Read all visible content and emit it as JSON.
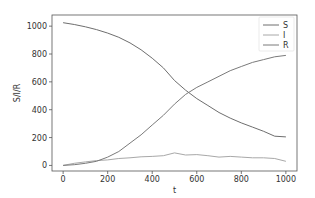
{
  "chart_data": {
    "type": "line",
    "title": "",
    "xlabel": "t",
    "ylabel": "S/I/R",
    "xlim": [
      -50,
      1050
    ],
    "ylim": [
      -40,
      1080
    ],
    "xticks": [
      0,
      200,
      400,
      600,
      800,
      1000
    ],
    "yticks": [
      0,
      200,
      400,
      600,
      800,
      1000
    ],
    "grid": false,
    "legend_position": "upper right",
    "x": [
      0,
      50,
      100,
      150,
      200,
      250,
      300,
      350,
      400,
      450,
      500,
      550,
      600,
      650,
      700,
      750,
      800,
      850,
      900,
      950,
      1000
    ],
    "series": [
      {
        "name": "S",
        "color": "#6e6e6e",
        "values": [
          1025,
          1012,
          995,
          975,
          950,
          920,
          880,
          830,
          770,
          700,
          610,
          540,
          480,
          430,
          380,
          340,
          305,
          275,
          245,
          210,
          205
        ]
      },
      {
        "name": "I",
        "color": "#a8a8a8",
        "values": [
          0,
          15,
          25,
          35,
          40,
          50,
          55,
          62,
          65,
          70,
          90,
          75,
          78,
          70,
          60,
          65,
          60,
          55,
          55,
          50,
          30
        ]
      },
      {
        "name": "R",
        "color": "#7a7a7a",
        "values": [
          0,
          5,
          15,
          30,
          60,
          100,
          160,
          220,
          290,
          360,
          440,
          510,
          560,
          600,
          640,
          680,
          710,
          740,
          760,
          780,
          790
        ]
      }
    ]
  }
}
